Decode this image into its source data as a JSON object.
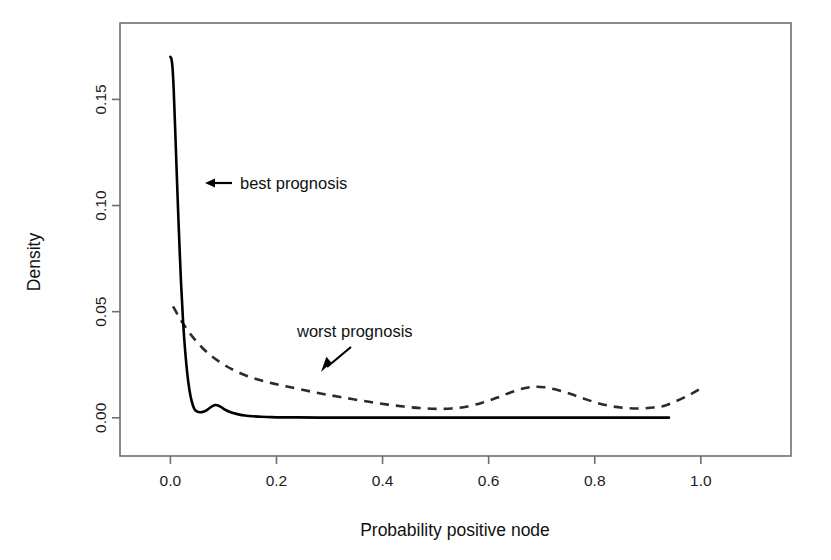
{
  "chart_data": {
    "type": "line",
    "title": "",
    "xlabel": "Probability positive node",
    "ylabel": "Density",
    "xlim": [
      -0.095,
      1.17
    ],
    "ylim": [
      -0.018,
      0.186
    ],
    "grid": false,
    "legend_position": "none",
    "xticks": [
      "0.0",
      "0.2",
      "0.4",
      "0.6",
      "0.8",
      "1.0"
    ],
    "xtick_values": [
      0.0,
      0.2,
      0.4,
      0.6,
      0.8,
      1.0
    ],
    "yticks": [
      "0.00",
      "0.05",
      "0.10",
      "0.15"
    ],
    "ytick_values": [
      0.0,
      0.05,
      0.1,
      0.15
    ],
    "annotations": [
      {
        "text": "best prognosis",
        "target_x": 0.009,
        "target_y": 0.1135,
        "style": "solid-curve-pointer"
      },
      {
        "text": "worst prognosis",
        "target_x": 0.235,
        "target_y": 0.0175,
        "style": "dashed-curve-pointer"
      }
    ],
    "series": [
      {
        "name": "best prognosis",
        "style": "solid",
        "color": "#000000",
        "x": [
          0.0,
          0.002,
          0.004,
          0.006,
          0.008,
          0.01,
          0.013,
          0.016,
          0.02,
          0.024,
          0.028,
          0.032,
          0.036,
          0.04,
          0.045,
          0.05,
          0.056,
          0.062,
          0.068,
          0.074,
          0.08,
          0.085,
          0.09,
          0.096,
          0.102,
          0.11,
          0.12,
          0.13,
          0.14,
          0.155,
          0.17,
          0.19,
          0.21,
          0.24,
          0.28,
          0.33,
          0.39,
          0.45,
          0.52,
          0.6,
          0.68,
          0.76,
          0.84,
          0.9,
          0.94
        ],
        "y": [
          0.17,
          0.169,
          0.165,
          0.156,
          0.143,
          0.129,
          0.108,
          0.088,
          0.064,
          0.045,
          0.031,
          0.0205,
          0.013,
          0.008,
          0.0042,
          0.003,
          0.0026,
          0.0028,
          0.0035,
          0.0046,
          0.0056,
          0.006,
          0.0058,
          0.005,
          0.004,
          0.003,
          0.0021,
          0.0015,
          0.0011,
          0.0007,
          0.0005,
          0.0003,
          0.0002,
          0.0002,
          0.0001,
          0.0001,
          0.0001,
          0.0001,
          0.0001,
          0.0001,
          0.0001,
          0.0001,
          0.0001,
          0.0001,
          0.0001
        ]
      },
      {
        "name": "worst prognosis",
        "style": "dashed",
        "color": "#2b2b2b",
        "x": [
          0.005,
          0.015,
          0.025,
          0.035,
          0.045,
          0.06,
          0.075,
          0.09,
          0.105,
          0.12,
          0.14,
          0.16,
          0.18,
          0.2,
          0.22,
          0.245,
          0.27,
          0.295,
          0.32,
          0.35,
          0.38,
          0.41,
          0.44,
          0.47,
          0.5,
          0.53,
          0.56,
          0.59,
          0.615,
          0.64,
          0.665,
          0.685,
          0.705,
          0.73,
          0.755,
          0.78,
          0.805,
          0.83,
          0.855,
          0.88,
          0.905,
          0.93,
          0.955,
          0.98,
          1.0
        ],
        "y": [
          0.0525,
          0.048,
          0.044,
          0.0404,
          0.0372,
          0.033,
          0.0296,
          0.0268,
          0.0244,
          0.0224,
          0.0202,
          0.0184,
          0.017,
          0.0158,
          0.0147,
          0.0134,
          0.0121,
          0.0109,
          0.0098,
          0.0085,
          0.0073,
          0.0062,
          0.0053,
          0.0046,
          0.0042,
          0.0044,
          0.0053,
          0.0073,
          0.0094,
          0.0118,
          0.0138,
          0.0146,
          0.0144,
          0.0131,
          0.0112,
          0.009,
          0.007,
          0.0055,
          0.0047,
          0.0044,
          0.0047,
          0.0056,
          0.008,
          0.011,
          0.0138
        ]
      }
    ]
  },
  "plot": {
    "frame": {
      "left": 120,
      "top": 23,
      "right": 791,
      "bottom": 456
    }
  }
}
